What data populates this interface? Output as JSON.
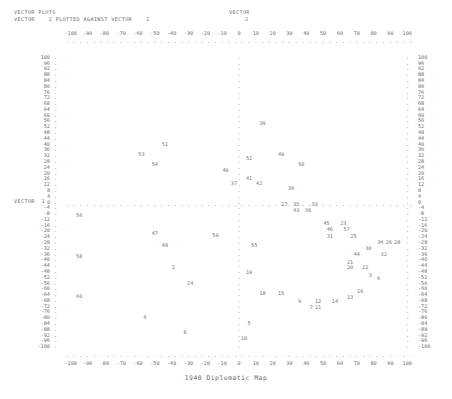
{
  "header": {
    "line1": "VECTOR PLOTS",
    "line2": "VECTOR    2 PLOTTED AGAINST VECTOR    1",
    "vector_y_label_top": "VECTOR",
    "vector_y_label_bottom": "2",
    "vector_x_label": "VECTOR  1"
  },
  "title": "1940 Diplomatic Map",
  "chart_data": {
    "type": "scatter",
    "title": "1940 Diplomatic Map",
    "xlabel": "VECTOR 1",
    "ylabel": "VECTOR 2",
    "xlim": [
      -104,
      104
    ],
    "ylim": [
      -104,
      104
    ],
    "grid": false,
    "legend": "none",
    "axis_style": "dotted-character-axes",
    "xticks": [
      -100,
      -90,
      -80,
      -70,
      -60,
      -50,
      -40,
      -30,
      -20,
      -10,
      0,
      10,
      20,
      30,
      40,
      50,
      60,
      70,
      80,
      90,
      100
    ],
    "xticklabels": [
      "-100",
      "-90",
      "-80",
      "-70",
      "-60",
      "-50",
      "-40",
      "-30",
      "-20",
      "-10",
      "0",
      "10",
      "20",
      "30",
      "40",
      "50",
      "60",
      "70",
      "80",
      "90",
      "100"
    ],
    "yticks": [
      100,
      96,
      92,
      88,
      84,
      80,
      76,
      72,
      68,
      64,
      60,
      56,
      52,
      48,
      44,
      40,
      36,
      32,
      28,
      24,
      20,
      16,
      12,
      8,
      4,
      0,
      -4,
      -8,
      -12,
      -16,
      -20,
      -24,
      -28,
      -32,
      -36,
      -40,
      -44,
      -48,
      -52,
      -56,
      -60,
      -64,
      -68,
      -72,
      -76,
      -80,
      -84,
      -88,
      -92,
      -96,
      -100
    ],
    "yticklabels": [
      "100",
      "96",
      "92",
      "88",
      "84",
      "80",
      "76",
      "72",
      "68",
      "64",
      "60",
      "56",
      "52",
      "48",
      "44",
      "40",
      "36",
      "32",
      "28",
      "24",
      "20",
      "16",
      "12",
      "8",
      "4",
      "0",
      "-4",
      "-8",
      "-12",
      "-16",
      "-20",
      "-24",
      "-28",
      "-32",
      "-36",
      "-40",
      "-44",
      "-48",
      "-52",
      "-56",
      "-60",
      "-64",
      "-68",
      "-72",
      "-76",
      "-80",
      "-84",
      "-88",
      "-92",
      "-96",
      "-100"
    ],
    "point_labels_are_ids": true,
    "points": [
      {
        "label": "39",
        "x": 14,
        "y": 54
      },
      {
        "label": "51",
        "x": -44,
        "y": 40
      },
      {
        "label": "53",
        "x": -58,
        "y": 33
      },
      {
        "label": "49",
        "x": 25,
        "y": 33
      },
      {
        "label": "52",
        "x": 6,
        "y": 30
      },
      {
        "label": "54",
        "x": -50,
        "y": 26
      },
      {
        "label": "50",
        "x": 37,
        "y": 26
      },
      {
        "label": "40",
        "x": -8,
        "y": 22
      },
      {
        "label": "41",
        "x": 6,
        "y": 16
      },
      {
        "label": "37",
        "x": -3,
        "y": 13
      },
      {
        "label": "42",
        "x": 12,
        "y": 13
      },
      {
        "label": "36",
        "x": 31,
        "y": 9
      },
      {
        "label": "27",
        "x": 27,
        "y": -2
      },
      {
        "label": "35",
        "x": 34,
        "y": -2
      },
      {
        "label": "33",
        "x": 45,
        "y": -2
      },
      {
        "label": "43",
        "x": 34,
        "y": -6
      },
      {
        "label": "38",
        "x": 41,
        "y": -6
      },
      {
        "label": "56",
        "x": -95,
        "y": -9
      },
      {
        "label": "45",
        "x": 52,
        "y": -15
      },
      {
        "label": "23",
        "x": 62,
        "y": -15
      },
      {
        "label": "46",
        "x": 54,
        "y": -19
      },
      {
        "label": "57",
        "x": 64,
        "y": -19
      },
      {
        "label": "47",
        "x": -50,
        "y": -22
      },
      {
        "label": "59",
        "x": -14,
        "y": -23
      },
      {
        "label": "31",
        "x": 54,
        "y": -24
      },
      {
        "label": "25",
        "x": 68,
        "y": -24
      },
      {
        "label": "34",
        "x": 84,
        "y": -28
      },
      {
        "label": "26",
        "x": 89,
        "y": -28
      },
      {
        "label": "28",
        "x": 94,
        "y": -28
      },
      {
        "label": "48",
        "x": -44,
        "y": -30
      },
      {
        "label": "55",
        "x": 9,
        "y": -30
      },
      {
        "label": "30",
        "x": 77,
        "y": -32
      },
      {
        "label": "58",
        "x": -95,
        "y": -38
      },
      {
        "label": "44",
        "x": 70,
        "y": -36
      },
      {
        "label": "32",
        "x": 86,
        "y": -36
      },
      {
        "label": "21",
        "x": 66,
        "y": -42
      },
      {
        "label": "2",
        "x": -39,
        "y": -45
      },
      {
        "label": "22",
        "x": 75,
        "y": -45
      },
      {
        "label": "20",
        "x": 66,
        "y": -45
      },
      {
        "label": "19",
        "x": 6,
        "y": -49
      },
      {
        "label": "3",
        "x": 78,
        "y": -51
      },
      {
        "label": "6",
        "x": 83,
        "y": -53
      },
      {
        "label": "24",
        "x": -29,
        "y": -56
      },
      {
        "label": "60",
        "x": -95,
        "y": -65
      },
      {
        "label": "18",
        "x": 14,
        "y": -63
      },
      {
        "label": "15",
        "x": 25,
        "y": -63
      },
      {
        "label": "16",
        "x": 72,
        "y": -62
      },
      {
        "label": "13",
        "x": 66,
        "y": -66
      },
      {
        "label": "9",
        "x": 36,
        "y": -69
      },
      {
        "label": "12",
        "x": 47,
        "y": -69
      },
      {
        "label": "14",
        "x": 57,
        "y": -69
      },
      {
        "label": "7",
        "x": 43,
        "y": -73
      },
      {
        "label": "11",
        "x": 47,
        "y": -73
      },
      {
        "label": "4",
        "x": -56,
        "y": -80
      },
      {
        "label": "5",
        "x": 6,
        "y": -84
      },
      {
        "label": "8",
        "x": -32,
        "y": -90
      },
      {
        "label": "10",
        "x": 3,
        "y": -94
      }
    ]
  }
}
